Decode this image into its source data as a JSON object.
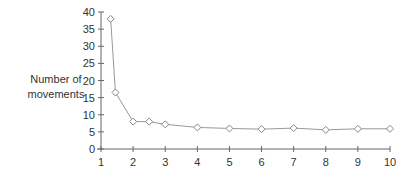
{
  "chart_data": {
    "type": "line",
    "title": "",
    "xlabel": "",
    "ylabel": "Number of movements",
    "ylabel_lines": [
      "Number of",
      "movements"
    ],
    "xlim": [
      1,
      10
    ],
    "ylim": [
      0,
      40
    ],
    "x_ticks": [
      1,
      2,
      3,
      4,
      5,
      6,
      7,
      8,
      9,
      10
    ],
    "y_ticks": [
      0,
      5,
      10,
      15,
      20,
      25,
      30,
      35,
      40
    ],
    "grid": false,
    "legend": null,
    "marker": "diamond-open",
    "line_color": "#999999",
    "series": [
      {
        "name": "Number of movements",
        "x": [
          1.3,
          1.45,
          2,
          2.5,
          3,
          4,
          5,
          6,
          7,
          8,
          9,
          10
        ],
        "values": [
          38,
          16.5,
          8,
          8,
          7.2,
          6.3,
          6,
          5.8,
          6.1,
          5.6,
          5.9,
          5.9
        ]
      }
    ]
  }
}
